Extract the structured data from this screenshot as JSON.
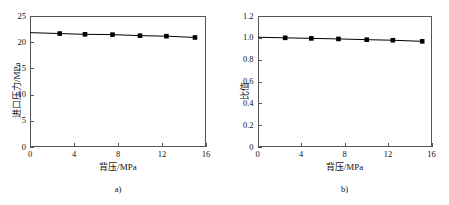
{
  "figure": {
    "panels": [
      {
        "caption": "a)",
        "xlabel": "背压/MPa",
        "ylabel": "进口压力/MPa",
        "xticks": [
          "0",
          "4",
          "8",
          "12",
          "16"
        ],
        "yticks": [
          "0",
          "5",
          "10",
          "15",
          "20",
          "25"
        ]
      },
      {
        "caption": "b)",
        "xlabel": "背压/MPa",
        "ylabel": "比值",
        "xticks": [
          "0",
          "4",
          "8",
          "12",
          "16"
        ],
        "yticks": [
          "0",
          "0.2",
          "0.4",
          "0.6",
          "0.8",
          "1.0",
          "1.2"
        ]
      }
    ]
  },
  "chart_data": [
    {
      "type": "line",
      "title": "",
      "subfigure": "a)",
      "xlabel": "背压/MPa",
      "ylabel": "进口压力/MPa",
      "xlim": [
        0,
        16
      ],
      "ylim": [
        0,
        25
      ],
      "xticks": [
        0,
        4,
        8,
        12,
        16
      ],
      "yticks": [
        0,
        5,
        10,
        15,
        20,
        25
      ],
      "grid": false,
      "legend": null,
      "marker": "square",
      "marker_color": "#000000",
      "line_color": "#000000",
      "x": [
        2.7,
        5.0,
        7.5,
        10.0,
        12.4,
        15.0
      ],
      "y": [
        21.65,
        21.5,
        21.45,
        21.25,
        21.15,
        20.9
      ]
    },
    {
      "type": "line",
      "title": "",
      "subfigure": "b)",
      "xlabel": "背压/MPa",
      "ylabel": "比值",
      "xlim": [
        0,
        16
      ],
      "ylim": [
        0,
        1.2
      ],
      "xticks": [
        0,
        4,
        8,
        12,
        16
      ],
      "yticks": [
        0,
        0.2,
        0.4,
        0.6,
        0.8,
        1.0,
        1.2
      ],
      "grid": false,
      "legend": null,
      "marker": "square",
      "marker_color": "#000000",
      "line_color": "#000000",
      "x": [
        2.5,
        4.9,
        7.4,
        10.0,
        12.4,
        15.1
      ],
      "y": [
        1.0,
        0.995,
        0.99,
        0.983,
        0.978,
        0.968
      ]
    }
  ]
}
